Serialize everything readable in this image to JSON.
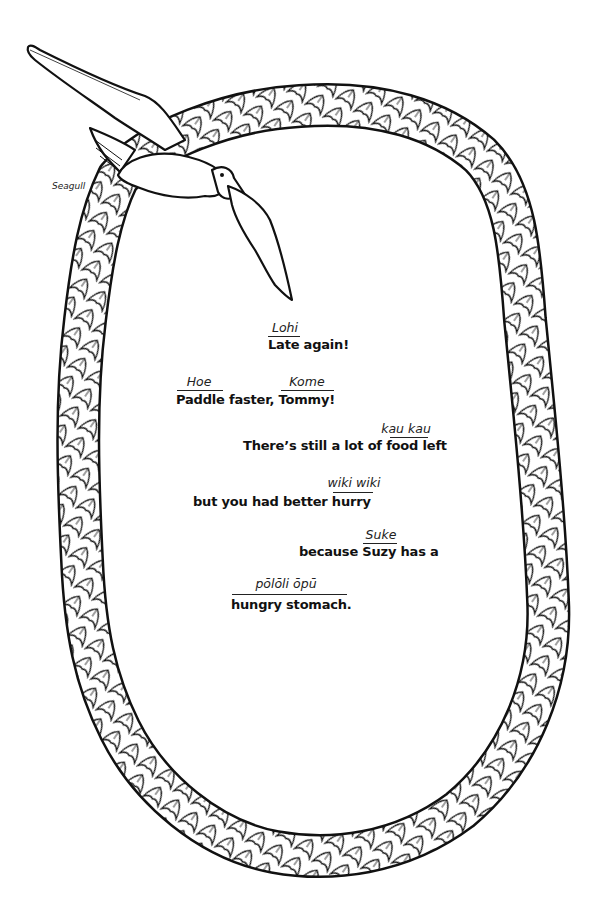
{
  "illustration": {
    "bird_label": "Seagull",
    "colors": {
      "ink": "#111111",
      "paper": "#ffffff"
    }
  },
  "poem": {
    "lines": [
      {
        "text": "Late again!",
        "glosses": [
          {
            "word": "Lohi",
            "over": "Late"
          }
        ]
      },
      {
        "text": "Paddle faster, Tommy!",
        "glosses": [
          {
            "word": "Hoe",
            "over": "Paddle"
          },
          {
            "word": "Kome",
            "over": "Tommy!"
          }
        ]
      },
      {
        "text": "There’s still a lot of food left",
        "glosses": [
          {
            "word": "kau kau",
            "over": "food"
          }
        ]
      },
      {
        "text": "but you had better hurry",
        "glosses": [
          {
            "word": "wiki wiki",
            "over": "hurry"
          }
        ]
      },
      {
        "text": "because Suzy has a",
        "glosses": [
          {
            "word": "Suke",
            "over": "Suzy"
          }
        ]
      },
      {
        "text": "hungry stomach.",
        "glosses": [
          {
            "word": "pōlōli ōpū",
            "over": "hungry stomach"
          }
        ]
      }
    ]
  }
}
